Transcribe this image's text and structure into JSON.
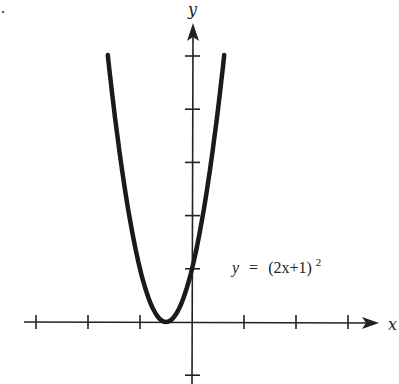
{
  "chart_data": {
    "type": "line",
    "title": "",
    "xlabel": "x",
    "ylabel": "y",
    "annotation": "y = (2x+1)^2",
    "annotation_parts": {
      "lhs": "y",
      "eq": "=",
      "base": "(2x+1)",
      "exp": "2"
    },
    "xlim": [
      -3.2,
      3.6
    ],
    "ylim": [
      -1.2,
      5.6
    ],
    "x_ticks": [
      -3,
      -2,
      -1,
      1,
      2,
      3
    ],
    "y_ticks": [
      -1,
      1,
      2,
      3,
      4,
      5
    ],
    "tick_labels_shown": false,
    "grid": false,
    "series": [
      {
        "name": "y = (2x+1)^2",
        "x": [
          -1.62,
          -1.5,
          -1.25,
          -1.0,
          -0.75,
          -0.5,
          -0.25,
          0.0,
          0.25,
          0.5,
          0.62
        ],
        "y": [
          5.02,
          4.0,
          2.25,
          1.0,
          0.25,
          0.0,
          0.25,
          1.0,
          2.25,
          4.0,
          5.02
        ]
      }
    ],
    "features": {
      "vertex": [
        -0.5,
        0
      ],
      "y_intercept": [
        0,
        1
      ]
    }
  },
  "corner_mark": "."
}
